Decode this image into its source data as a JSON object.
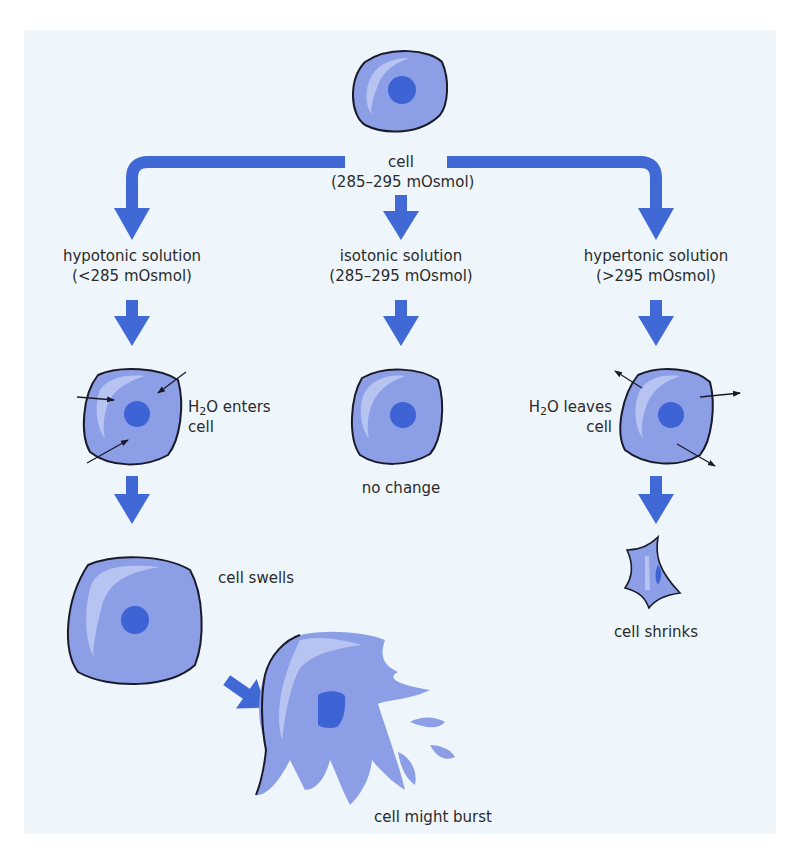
{
  "colors": {
    "background": "#ffffff",
    "panel": "#eef6fb",
    "arrow": "#4169d6",
    "cell_fill": "#8c9ee6",
    "cell_highlight": "#b7c4f2",
    "nucleus": "#3d63d4",
    "outline": "#1a1a2a",
    "text": "#2b2b2b"
  },
  "top": {
    "label_line1": "cell",
    "label_line2": "(285–295 mOsmol)"
  },
  "branches": [
    {
      "id": "hypotonic",
      "label_line1": "hypotonic solution",
      "label_line2": "(<285 mOsmol)",
      "water_prefix": "H",
      "water_sub": "2",
      "water_suffix": "O enters",
      "water_line2": "cell",
      "result_label": "cell swells",
      "final_label": "cell might burst"
    },
    {
      "id": "isotonic",
      "label_line1": "isotonic solution",
      "label_line2": "(285–295 mOsmol)",
      "result_label": "no change"
    },
    {
      "id": "hypertonic",
      "label_line1": "hypertonic solution",
      "label_line2": "(>295 mOsmol)",
      "water_prefix": "H",
      "water_sub": "2",
      "water_suffix": "O leaves",
      "water_line2": "cell",
      "result_label": "cell shrinks"
    }
  ]
}
